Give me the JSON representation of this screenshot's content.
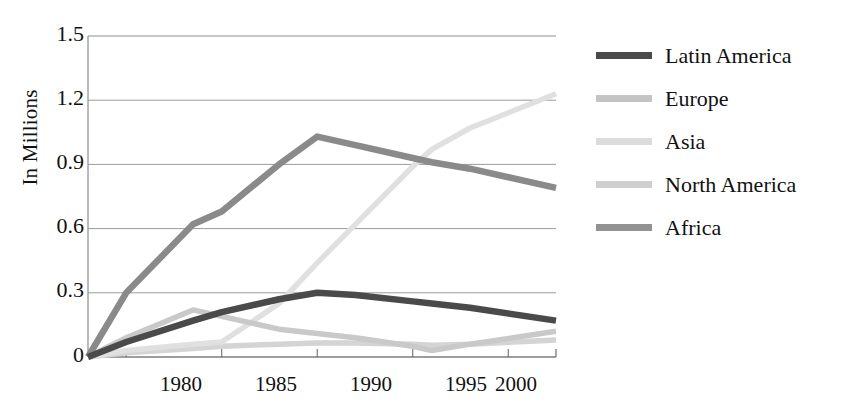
{
  "chart_data": {
    "type": "line",
    "title": "",
    "subtitle": "",
    "xlabel": "",
    "ylabel": "In Millions",
    "xlim": [
      1978,
      2002.5
    ],
    "ylim": [
      0,
      1.5
    ],
    "xticks": [
      "1980",
      "1985",
      "1990",
      "1995",
      "2000"
    ],
    "xtick_values": [
      1980,
      1985,
      1990,
      1995,
      2000
    ],
    "yticks": [
      "0",
      "0.3",
      "0.6",
      "0.9",
      "1.2",
      "1.5"
    ],
    "ytick_values": [
      0,
      0.3,
      0.6,
      0.9,
      1.2,
      1.5
    ],
    "grid": true,
    "grid_axis": "y",
    "legend_position": "right",
    "x": [
      1978,
      1980,
      1983.5,
      1985,
      1988,
      1990,
      1992,
      1995,
      1996,
      1998,
      2002.5
    ],
    "series": [
      {
        "name": "Latin America",
        "color": "#4a4a4a",
        "values": [
          0.0,
          0.07,
          0.17,
          0.21,
          0.27,
          0.3,
          0.29,
          0.26,
          0.25,
          0.23,
          0.17
        ]
      },
      {
        "name": "Europe",
        "color": "#c9c9c9",
        "values": [
          0.0,
          0.09,
          0.22,
          0.19,
          0.13,
          0.11,
          0.09,
          0.05,
          0.03,
          0.06,
          0.12
        ]
      },
      {
        "name": "Asia",
        "color": "#e0e0e0",
        "values": [
          0.0,
          0.03,
          0.06,
          0.07,
          0.25,
          0.44,
          0.62,
          0.89,
          0.97,
          1.07,
          1.23
        ]
      },
      {
        "name": "North America",
        "color": "#d4d4d4",
        "values": [
          0.0,
          0.02,
          0.04,
          0.05,
          0.06,
          0.065,
          0.065,
          0.06,
          0.055,
          0.06,
          0.08
        ]
      },
      {
        "name": "Africa",
        "color": "#8a8a8a",
        "values": [
          0.0,
          0.3,
          0.62,
          0.68,
          0.9,
          1.03,
          0.99,
          0.93,
          0.91,
          0.88,
          0.79
        ]
      }
    ]
  },
  "legend": {
    "items": [
      {
        "label": "Latin America",
        "color": "#4a4a4a"
      },
      {
        "label": "Europe",
        "color": "#c4c4c4"
      },
      {
        "label": "Asia",
        "color": "#dcdcdc"
      },
      {
        "label": "North America",
        "color": "#cfcfcf"
      },
      {
        "label": "Africa",
        "color": "#939393"
      }
    ]
  },
  "axes": {
    "ylabel": "In Millions",
    "ytick_labels": [
      "1.5",
      "1.2",
      "0.9",
      "0.6",
      "0.3",
      "0"
    ],
    "xtick_labels": [
      "1980",
      "1985",
      "1990",
      "1995",
      "2000"
    ]
  }
}
